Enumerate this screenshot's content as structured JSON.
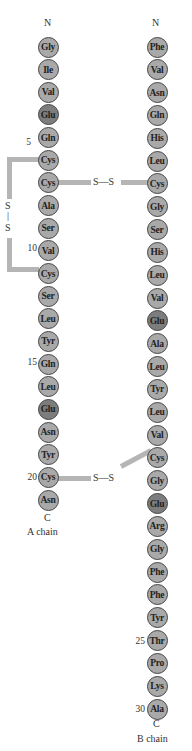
{
  "a_chain": {
    "label": "A chain",
    "n_term": "N",
    "c_term": "C",
    "residues": [
      "Gly",
      "Ile",
      "Val",
      "Glu",
      "Gln",
      "Cys",
      "Cys",
      "Ala",
      "Ser",
      "Val",
      "Cys",
      "Ser",
      "Leu",
      "Tyr",
      "Gln",
      "Leu",
      "Glu",
      "Asn",
      "Tyr",
      "Cys",
      "Asn"
    ],
    "numbers": {
      "5": "5",
      "10": "10",
      "15": "15",
      "20": "20"
    }
  },
  "b_chain": {
    "label": "B chain",
    "n_term": "N",
    "c_term": "C",
    "residues": [
      "Phe",
      "Val",
      "Asn",
      "Gln",
      "His",
      "Leu",
      "Cys",
      "Gly",
      "Ser",
      "His",
      "Leu",
      "Val",
      "Glu",
      "Ala",
      "Leu",
      "Tyr",
      "Leu",
      "Val",
      "Cys",
      "Gly",
      "Glu",
      "Arg",
      "Gly",
      "Phe",
      "Phe",
      "Tyr",
      "Thr",
      "Pro",
      "Lys",
      "Ala"
    ],
    "numbers": {
      "25": "25",
      "30": "30"
    }
  },
  "disulfides": {
    "intra_a": {
      "top": "S",
      "bond": "|",
      "bottom": "S"
    },
    "a7_b7": "S—S",
    "a20_b19": "S—S"
  },
  "colors": {
    "residue": "#a9a9a9",
    "acidic_residue": "#7d7d7d",
    "bond": "#b5b5b5"
  }
}
